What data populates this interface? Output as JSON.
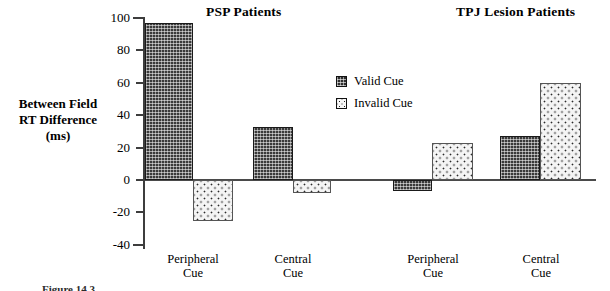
{
  "figure": {
    "panel_titles": {
      "left": "PSP Patients",
      "right": "TPJ Lesion Patients"
    },
    "ylabel_lines": [
      "Between Field",
      "RT Difference",
      "(ms)"
    ],
    "caption": "Figure 14.3"
  },
  "legend": {
    "position": "inside-top-center",
    "items": [
      {
        "label": "Valid Cue",
        "pattern": "dark-crosshatch",
        "color": "#3a3a3a"
      },
      {
        "label": "Invalid Cue",
        "pattern": "light-dotted",
        "color": "#f4f4f4"
      }
    ]
  },
  "axis": {
    "ticks": [
      100,
      80,
      60,
      40,
      20,
      0,
      -20,
      -40
    ],
    "tick_labels": [
      "100",
      "80",
      "60",
      "40",
      "20",
      "0",
      "-20",
      "-40"
    ]
  },
  "chart_data": {
    "type": "bar",
    "title": "",
    "xlabel": "",
    "ylabel": "Between Field RT Difference (ms)",
    "ylim": [
      -40,
      100
    ],
    "ytick_step": 20,
    "grid": false,
    "legend_position": "inside-top-center",
    "panels": [
      {
        "name": "PSP Patients",
        "categories": [
          "Peripheral Cue",
          "Central Cue"
        ],
        "series": [
          {
            "name": "Valid Cue",
            "values": [
              97,
              33
            ]
          },
          {
            "name": "Invalid Cue",
            "values": [
              -25,
              -8
            ]
          }
        ]
      },
      {
        "name": "TPJ Lesion Patients",
        "categories": [
          "Peripheral Cue",
          "Central Cue"
        ],
        "series": [
          {
            "name": "Valid Cue",
            "values": [
              -7,
              27
            ]
          },
          {
            "name": "Invalid Cue",
            "values": [
              23,
              60
            ]
          }
        ]
      }
    ],
    "categories": [
      "Peripheral Cue",
      "Central Cue",
      "Peripheral Cue",
      "Central Cue"
    ],
    "bars": [
      {
        "panel": "PSP Patients",
        "category": "Peripheral Cue",
        "series": "Valid Cue",
        "value": 97
      },
      {
        "panel": "PSP Patients",
        "category": "Peripheral Cue",
        "series": "Invalid Cue",
        "value": -25
      },
      {
        "panel": "PSP Patients",
        "category": "Central Cue",
        "series": "Valid Cue",
        "value": 33
      },
      {
        "panel": "PSP Patients",
        "category": "Central Cue",
        "series": "Invalid Cue",
        "value": -8
      },
      {
        "panel": "TPJ Lesion Patients",
        "category": "Peripheral Cue",
        "series": "Valid Cue",
        "value": -7
      },
      {
        "panel": "TPJ Lesion Patients",
        "category": "Peripheral Cue",
        "series": "Invalid Cue",
        "value": 23
      },
      {
        "panel": "TPJ Lesion Patients",
        "category": "Central Cue",
        "series": "Valid Cue",
        "value": 27
      },
      {
        "panel": "TPJ Lesion Patients",
        "category": "Central Cue",
        "series": "Invalid Cue",
        "value": 60
      }
    ]
  },
  "xlabels": [
    {
      "line1": "Peripheral",
      "line2": "Cue"
    },
    {
      "line1": "Central",
      "line2": "Cue"
    },
    {
      "line1": "Peripheral",
      "line2": "Cue"
    },
    {
      "line1": "Central",
      "line2": "Cue"
    }
  ]
}
